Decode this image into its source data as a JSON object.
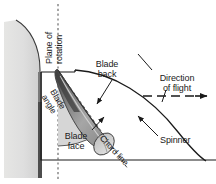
{
  "figure": {
    "type": "technical-diagram",
    "background_color": "#ffffff",
    "line_color": "#1a1a1a",
    "width": 216,
    "height": 184
  },
  "labels": {
    "plane_of_rotation": "Plane of\nrotation",
    "blade_back": "Blade\nback",
    "direction_of_flight": "Direction\nof flight",
    "blade_angle": "Blade\nangle",
    "blade_face": "Blade\nface",
    "chord_line": "Chord line",
    "spinner": "Spinner"
  },
  "colors": {
    "cowling_fill": "#dededc",
    "cowling_edge": "#8c8c8c",
    "blade_fill_dark": "#575757",
    "blade_fill_mid": "#9a9a9a",
    "blade_fill_light": "#c8c8c8",
    "angle_wedge_fill": "#d2d2d2",
    "line": "#1a1a1a",
    "dash": "#6e6e6e"
  },
  "elements": {
    "cowling": "engine-cowling-cross-section",
    "spinner_outline": "spinner-cone-outline",
    "plane_of_rotation_line": "vertical-dashed-line",
    "flight_arrow": "dashed-horizontal-arrow-right",
    "blade_cross_section": "airfoil-blade-section",
    "angle_wedge": "blade-angle-sector",
    "chord_line_marker": "chord-line-dashed"
  }
}
